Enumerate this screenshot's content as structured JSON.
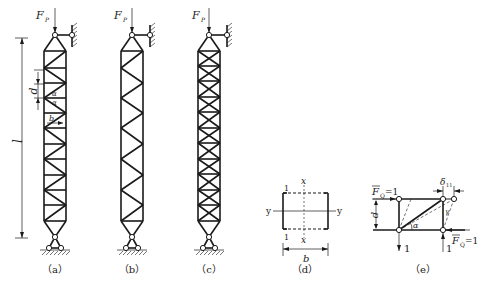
{
  "figure": {
    "panels": [
      {
        "id": "a",
        "caption": "（a）",
        "load_label": "F",
        "load_sub": "P",
        "dims": {
          "length": "l",
          "panel": "d",
          "angle": "α",
          "width": "b"
        }
      },
      {
        "id": "b",
        "caption": "（b）",
        "load_label": "F",
        "load_sub": "P"
      },
      {
        "id": "c",
        "caption": "（c）",
        "load_label": "F",
        "load_sub": "P"
      },
      {
        "id": "d",
        "caption": "（d）",
        "axes": {
          "x_top": "x",
          "x_bottom": "x",
          "y_left": "y",
          "y_right": "y"
        },
        "section_top": "1",
        "section_bottom": "1",
        "width": "b"
      },
      {
        "id": "e",
        "caption": "（e）",
        "force_top": "F",
        "force_sub": "Q",
        "force_value": "=1",
        "force_bottom_value": "=1",
        "reaction_left": "1",
        "reaction_right": "1",
        "panel": "d",
        "angle": "α",
        "shear_angle": "γ",
        "deflection": "δ",
        "deflection_sub": "11"
      }
    ]
  }
}
